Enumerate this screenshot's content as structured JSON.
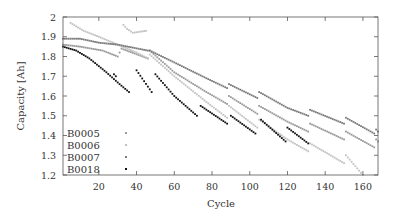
{
  "chart_data": {
    "type": "scatter",
    "title": "",
    "xlabel": "Cycle",
    "ylabel": "Capacity [Ah]",
    "xlim": [
      1,
      168
    ],
    "ylim": [
      1.2,
      2.0
    ],
    "grid": false,
    "legend_position": "bottom-left",
    "xticks": [
      20,
      40,
      60,
      80,
      100,
      120,
      140,
      160
    ],
    "yticks": [
      1.2,
      1.3,
      1.4,
      1.5,
      1.6,
      1.7,
      1.8,
      1.9,
      2
    ],
    "xtick_labels": [
      "20",
      "40",
      "60",
      "80",
      "100",
      "120",
      "140",
      "160"
    ],
    "ytick_labels": [
      "1.2",
      "1.3",
      "1.4",
      "1.5",
      "1.6",
      "1.7",
      "1.8",
      "1.9",
      "2"
    ],
    "series": [
      {
        "name": "B0005",
        "color": "#9a9a9a",
        "segments": [
          [
            [
              1,
              1.86
            ],
            [
              10,
              1.85
            ],
            [
              22,
              1.83
            ],
            [
              30,
              1.8
            ],
            [
              32,
              1.84
            ],
            [
              46,
              1.79
            ]
          ],
          [
            [
              47,
              1.83
            ],
            [
              60,
              1.72
            ],
            [
              77,
              1.62
            ],
            [
              88,
              1.56
            ]
          ],
          [
            [
              89,
              1.6
            ],
            [
              104,
              1.51
            ]
          ],
          [
            [
              105,
              1.55
            ],
            [
              120,
              1.47
            ],
            [
              131,
              1.42
            ]
          ],
          [
            [
              132,
              1.46
            ],
            [
              150,
              1.38
            ]
          ],
          [
            [
              151,
              1.42
            ],
            [
              166,
              1.34
            ]
          ],
          [
            [
              167,
              1.38
            ],
            [
              168,
              1.37
            ]
          ]
        ]
      },
      {
        "name": "B0006",
        "color": "#c2c2c2",
        "segments": [
          [
            [
              5,
              1.97
            ],
            [
              12,
              1.93
            ],
            [
              20,
              1.9
            ],
            [
              30,
              1.86
            ],
            [
              40,
              1.82
            ],
            [
              46,
              1.79
            ]
          ],
          [
            [
              33,
              1.96
            ],
            [
              35,
              1.94
            ],
            [
              38,
              1.92
            ],
            [
              45,
              1.93
            ]
          ],
          [
            [
              47,
              1.81
            ],
            [
              60,
              1.7
            ],
            [
              77,
              1.57
            ],
            [
              88,
              1.49
            ]
          ],
          [
            [
              89,
              1.55
            ],
            [
              104,
              1.44
            ]
          ],
          [
            [
              105,
              1.48
            ],
            [
              120,
              1.38
            ],
            [
              131,
              1.32
            ]
          ],
          [
            [
              132,
              1.36
            ],
            [
              150,
              1.26
            ]
          ],
          [
            [
              151,
              1.3
            ],
            [
              160,
              1.2
            ]
          ]
        ]
      },
      {
        "name": "B0007",
        "color": "#7a7a7a",
        "segments": [
          [
            [
              1,
              1.89
            ],
            [
              10,
              1.89
            ],
            [
              20,
              1.87
            ],
            [
              30,
              1.86
            ],
            [
              46,
              1.83
            ]
          ],
          [
            [
              47,
              1.83
            ],
            [
              60,
              1.77
            ],
            [
              77,
              1.69
            ],
            [
              88,
              1.64
            ]
          ],
          [
            [
              89,
              1.66
            ],
            [
              104,
              1.59
            ]
          ],
          [
            [
              105,
              1.62
            ],
            [
              120,
              1.54
            ],
            [
              131,
              1.5
            ]
          ],
          [
            [
              132,
              1.53
            ],
            [
              150,
              1.46
            ]
          ],
          [
            [
              151,
              1.49
            ],
            [
              166,
              1.41
            ]
          ],
          [
            [
              167,
              1.43
            ],
            [
              168,
              1.42
            ]
          ]
        ]
      },
      {
        "name": "B0018",
        "color": "#111111",
        "segments": [
          [
            [
              1,
              1.85
            ],
            [
              8,
              1.83
            ],
            [
              15,
              1.79
            ],
            [
              24,
              1.72
            ],
            [
              31,
              1.66
            ],
            [
              36,
              1.62
            ]
          ],
          [
            [
              28,
              1.71
            ],
            [
              29,
              1.7
            ]
          ],
          [
            [
              40,
              1.73
            ],
            [
              48,
              1.62
            ]
          ],
          [
            [
              50,
              1.71
            ],
            [
              60,
              1.6
            ],
            [
              72,
              1.5
            ]
          ],
          [
            [
              74,
              1.55
            ],
            [
              88,
              1.46
            ]
          ],
          [
            [
              90,
              1.5
            ],
            [
              103,
              1.41
            ]
          ],
          [
            [
              106,
              1.48
            ],
            [
              119,
              1.37
            ]
          ],
          [
            [
              120,
              1.44
            ],
            [
              131,
              1.36
            ]
          ]
        ]
      }
    ]
  }
}
